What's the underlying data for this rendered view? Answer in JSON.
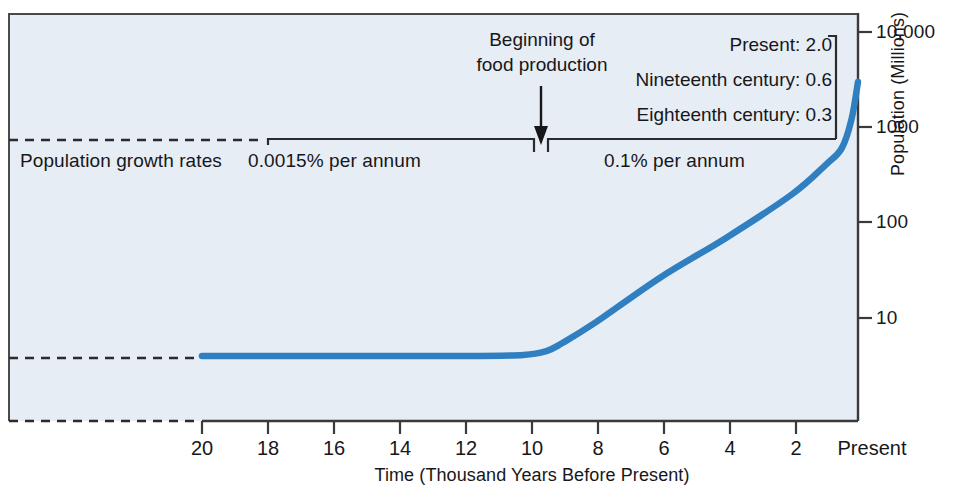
{
  "chart_data": {
    "type": "line",
    "title": "",
    "xlabel": "Time (Thousand Years Before Present)",
    "ylabel": "Population (Millions)",
    "x_ticks": [
      "20",
      "18",
      "16",
      "14",
      "12",
      "10",
      "8",
      "6",
      "4",
      "2",
      "Present"
    ],
    "x_tick_values": [
      20,
      18,
      16,
      14,
      12,
      10,
      8,
      6,
      4,
      2,
      0
    ],
    "xlim": [
      20,
      0
    ],
    "y_ticks": [
      "10,000",
      "1000",
      "100",
      "10"
    ],
    "y_tick_values": [
      10000,
      1000,
      100,
      10
    ],
    "y_scale": "log",
    "ylim": [
      1,
      10000
    ],
    "grid": false,
    "legend": "none",
    "series": [
      {
        "name": "World population",
        "x": [
          20.0,
          18.0,
          16.0,
          14.0,
          12.0,
          10.2,
          9.5,
          9.0,
          8.0,
          6.0,
          4.0,
          2.0,
          1.0,
          0.5,
          0.2,
          0.0
        ],
        "y": [
          4.0,
          4.0,
          4.0,
          4.0,
          4.0,
          4.1,
          4.5,
          5.5,
          9.0,
          27.0,
          70.0,
          200.0,
          400.0,
          600.0,
          1200.0,
          3000.0
        ]
      }
    ],
    "annotations": [
      {
        "name": "food-production-arrow",
        "text": "Beginning of\nfood production",
        "x_value": 10.0
      },
      {
        "name": "growth-rate-bracket-left",
        "text": "0.0015% per annum",
        "x_range": [
          20,
          10
        ]
      },
      {
        "name": "growth-rate-bracket-right",
        "text": "0.1% per annum",
        "x_range": [
          10,
          0
        ]
      },
      {
        "name": "growth-rate-series-label",
        "text": "Population growth rates"
      },
      {
        "name": "recent-rates",
        "items": [
          "Present: 2.0",
          "Nineteenth century: 0.6",
          "Eighteenth century: 0.3"
        ]
      }
    ],
    "colors": {
      "line": "#2f7fc1",
      "panel_background": "#e7edf4",
      "axis": "#3a3a3a",
      "text": "#17171a"
    }
  },
  "axes": {
    "x_label": "Time (Thousand Years Before Present)",
    "y_label": "Population (Millions)",
    "x_ticks": [
      {
        "label": "20",
        "px": 202
      },
      {
        "label": "18",
        "px": 268
      },
      {
        "label": "16",
        "px": 334
      },
      {
        "label": "14",
        "px": 400
      },
      {
        "label": "12",
        "px": 466
      },
      {
        "label": "10",
        "px": 532
      },
      {
        "label": "8",
        "px": 598
      },
      {
        "label": "6",
        "px": 664
      },
      {
        "label": "4",
        "px": 730
      },
      {
        "label": "2",
        "px": 796
      },
      {
        "label": "Present",
        "px": 858
      }
    ],
    "y_ticks": [
      {
        "label": "10,000",
        "px": 32
      },
      {
        "label": "1000",
        "px": 127
      },
      {
        "label": "100",
        "px": 222
      },
      {
        "label": "10",
        "px": 318
      }
    ]
  },
  "annotations": {
    "arrow_caption_line1": "Beginning of",
    "arrow_caption_line2": "food production",
    "growth_rates_label": "Population growth rates",
    "rate_left": "0.0015% per annum",
    "rate_right": "0.1% per annum",
    "rate_present": "Present: 2.0",
    "rate_nineteenth": "Nineteenth century: 0.6",
    "rate_eighteenth": "Eighteenth century: 0.3"
  }
}
